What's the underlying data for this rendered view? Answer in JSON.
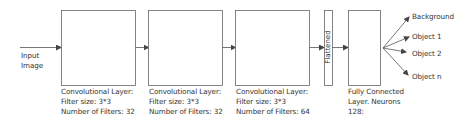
{
  "diagram": {
    "type": "cnn-architecture",
    "input": {
      "label_line1": "Input",
      "label_line2": "Image"
    },
    "conv_layers": [
      {
        "line1": "Convolutional Layer:",
        "line2": "Filter size: 3*3",
        "line3": "Number of Filters: 32"
      },
      {
        "line1": "Convolutional Layer:",
        "line2": "Filter size: 3*3",
        "line3": "Number of Filters: 32"
      },
      {
        "line1": "Convolutional Layer:",
        "line2": "Filter size: 3*3",
        "line3": "Number of Filters: 64"
      }
    ],
    "flatten": {
      "label": "Flattened"
    },
    "fully_connected": {
      "line1": "Fully Connected",
      "line2": "Layer. Neurons",
      "line3": "128:"
    },
    "outputs": [
      {
        "label": "Background"
      },
      {
        "label": "Object 1"
      },
      {
        "label": "Object 2"
      },
      {
        "label": "Object n"
      }
    ],
    "colors": {
      "stroke": "#555555",
      "text": "#333333",
      "background": "#ffffff"
    }
  }
}
